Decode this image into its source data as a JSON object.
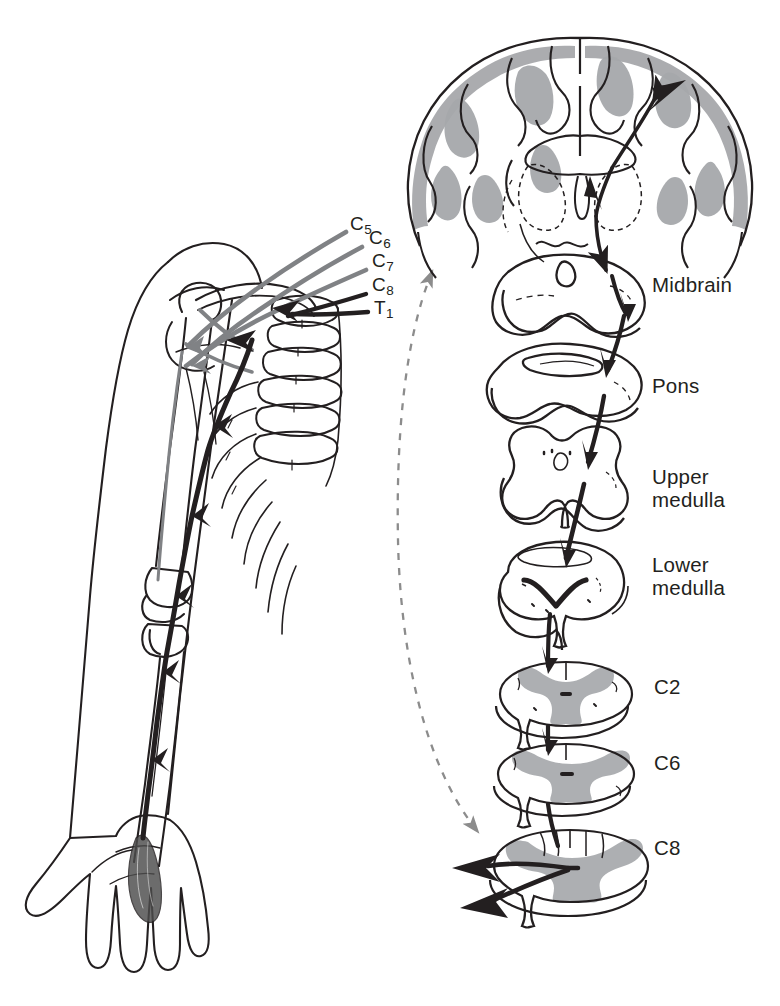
{
  "figure": {
    "alt_summary": "Left: outline drawing of a left arm, shoulder girdle, cervical vertebrae and ribs with gray and black nerve-root arrows. Right: a coronal brain section above a vertical stack of seven brainstem and spinal-cord cross-sections connected by a heavy black descending arrow. A dashed gray double-headed arrow links the two halves.",
    "colors": {
      "ink": "#231f20",
      "gray_matter_fill": "#a6a8ab",
      "gray_nerve": "#808285",
      "dashed_connector": "#8c8c8c",
      "background": "#ffffff"
    }
  },
  "brachial_plexus": {
    "caption": "",
    "root_labels": [
      {
        "id": "c5",
        "letter": "C",
        "number": "5",
        "x": 350,
        "y": 222,
        "color": "#231f20"
      },
      {
        "id": "c6",
        "letter": "C",
        "number": "6",
        "x": 369,
        "y": 236,
        "color": "#231f20"
      },
      {
        "id": "c7",
        "letter": "C",
        "number": "7",
        "x": 372,
        "y": 258,
        "color": "#231f20"
      },
      {
        "id": "c8",
        "letter": "C",
        "number": "8",
        "x": 372,
        "y": 283,
        "color": "#231f20"
      },
      {
        "id": "t1",
        "letter": "T",
        "number": "1",
        "x": 374,
        "y": 305,
        "color": "#231f20"
      }
    ],
    "anatomy_parts": [
      "arm-outline",
      "hand-outline",
      "humerus",
      "radius",
      "ulna",
      "elbow-joint",
      "clavicle",
      "scapula",
      "cervical-vertebrae",
      "ribs",
      "hand-intrinsic-muscle"
    ]
  },
  "cns_column": {
    "sections": [
      {
        "id": "cerebrum",
        "label": "",
        "label_x": 0,
        "label_y": 0,
        "has_label": false
      },
      {
        "id": "midbrain",
        "label": "Midbrain",
        "label_x": 652,
        "label_y": 283,
        "has_label": true
      },
      {
        "id": "pons",
        "label": "Pons",
        "label_x": 652,
        "label_y": 382,
        "has_label": true
      },
      {
        "id": "upper-medulla",
        "label": "Upper\nmedulla",
        "label_x": 652,
        "label_y": 474,
        "has_label": true
      },
      {
        "id": "lower-medulla",
        "label": "Lower\nmedulla",
        "label_x": 652,
        "label_y": 562,
        "has_label": true
      },
      {
        "id": "c2-cord",
        "label": "C2",
        "label_letter": "C",
        "label_number": "2",
        "label_x": 654,
        "label_y": 684,
        "has_label": true
      },
      {
        "id": "c6-cord",
        "label": "C6",
        "label_letter": "C",
        "label_number": "6",
        "label_x": 654,
        "label_y": 760,
        "has_label": true
      },
      {
        "id": "c8-cord",
        "label": "C8",
        "label_letter": "C",
        "label_number": "8",
        "label_x": 654,
        "label_y": 845,
        "has_label": true
      }
    ]
  },
  "connector": {
    "id": "dashed-connector",
    "style": "dashed",
    "arrowheads": "both",
    "color": "#8c8c8c"
  }
}
